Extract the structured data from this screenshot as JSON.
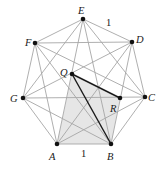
{
  "diagram": {
    "vertices": [
      {
        "name": "A",
        "x": 57,
        "y": 144,
        "lx": 49,
        "ly": 160
      },
      {
        "name": "B",
        "x": 111,
        "y": 144,
        "lx": 107,
        "ly": 160
      },
      {
        "name": "C",
        "x": 145,
        "y": 97,
        "lx": 148,
        "ly": 101
      },
      {
        "name": "D",
        "x": 132,
        "y": 42,
        "lx": 136,
        "ly": 43
      },
      {
        "name": "E",
        "x": 83,
        "y": 19,
        "lx": 78,
        "ly": 14
      },
      {
        "name": "F",
        "x": 35,
        "y": 43,
        "lx": 25,
        "ly": 46
      },
      {
        "name": "G",
        "x": 23,
        "y": 98,
        "lx": 10,
        "ly": 102
      }
    ],
    "inner_points": [
      {
        "name": "Q",
        "x": 72,
        "y": 74,
        "lx": 60,
        "ly": 76
      },
      {
        "name": "R",
        "x": 120,
        "y": 98,
        "lx": 110,
        "ly": 112
      }
    ],
    "shaded_region": [
      "Q",
      "R",
      "B",
      "A"
    ],
    "bold_segments": [
      [
        "Q",
        "B"
      ],
      [
        "Q",
        "R"
      ]
    ],
    "length_labels": [
      {
        "text": "1",
        "x": 106,
        "y": 26,
        "edge": "ED"
      },
      {
        "text": "1",
        "x": 81,
        "y": 157,
        "edge": "AB"
      }
    ],
    "colors": {
      "edge": "#a6a6a6",
      "bold": "#1a1a1a",
      "shade": "#e6e6e6"
    }
  }
}
